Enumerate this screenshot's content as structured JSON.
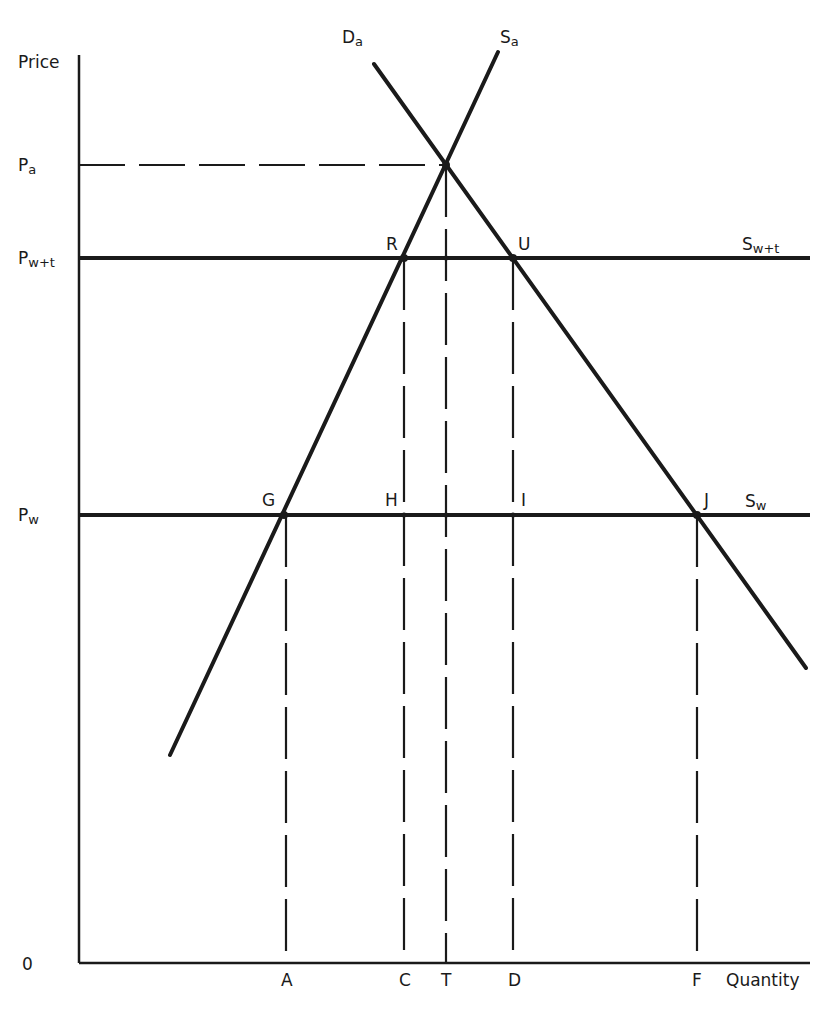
{
  "diagram": {
    "type": "economics-supply-demand-tariff",
    "axes": {
      "y_label": "Price",
      "x_label": "Quantity",
      "origin_label": "0"
    },
    "price_levels": [
      {
        "id": "pa",
        "label": "P",
        "sub": "a",
        "style": "dashed"
      },
      {
        "id": "pwt",
        "label": "P",
        "sub": "w+t",
        "style": "solid"
      },
      {
        "id": "pw",
        "label": "P",
        "sub": "w",
        "style": "solid"
      }
    ],
    "curves": [
      {
        "id": "sa",
        "label": "S",
        "sub": "a",
        "kind": "domestic supply"
      },
      {
        "id": "da",
        "label": "D",
        "sub": "a",
        "kind": "domestic demand"
      },
      {
        "id": "swt",
        "label": "S",
        "sub": "w+t",
        "kind": "world supply plus tariff"
      },
      {
        "id": "sw",
        "label": "S",
        "sub": "w",
        "kind": "world supply"
      }
    ],
    "points": {
      "R": "R",
      "U": "U",
      "G": "G",
      "H": "H",
      "I": "I",
      "J": "J"
    },
    "quantity_ticks": [
      "A",
      "C",
      "T",
      "D",
      "F"
    ]
  }
}
